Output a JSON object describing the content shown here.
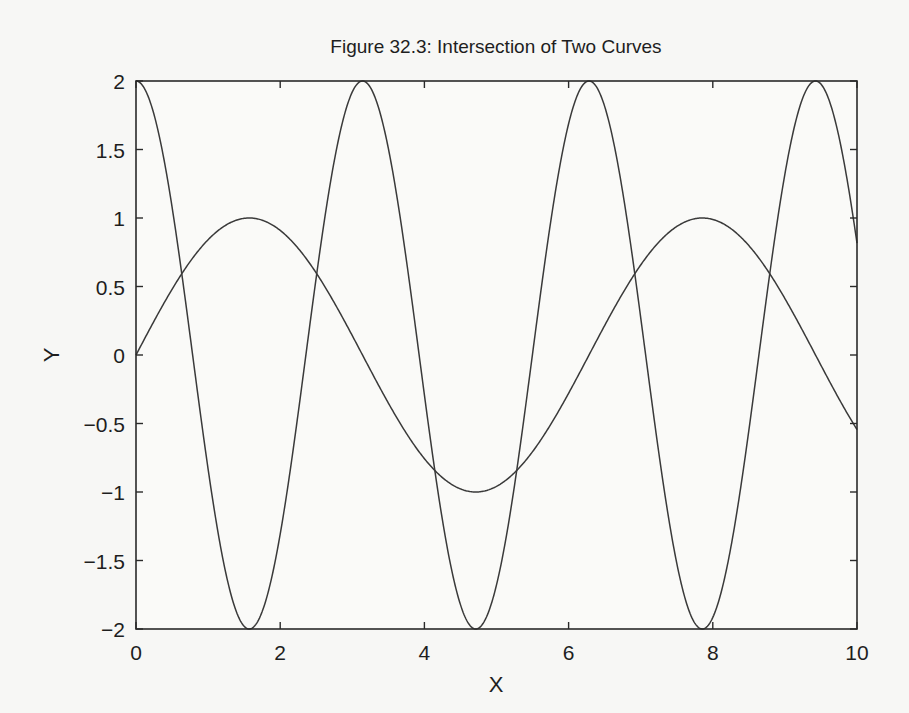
{
  "chart_data": {
    "type": "line",
    "title": "Figure 32.3: Intersection of Two Curves",
    "xlabel": "X",
    "ylabel": "Y",
    "xlim": [
      0,
      10
    ],
    "ylim": [
      -2,
      2
    ],
    "x_ticks": [
      0,
      2,
      4,
      6,
      8,
      10
    ],
    "x_tick_labels": [
      "0",
      "2",
      "4",
      "6",
      "8",
      "10"
    ],
    "y_ticks": [
      2,
      1.5,
      1,
      0.5,
      0,
      -0.5,
      -1,
      -1.5,
      -2
    ],
    "y_tick_labels": [
      "2",
      "1.5",
      "1",
      "0.5",
      "0",
      "−0.5",
      "−1",
      "−1.5",
      "−2"
    ],
    "grid": false,
    "legend": null,
    "series": [
      {
        "name": "sin(x)",
        "expression": "sin(x)",
        "x": [
          0,
          1,
          1.5708,
          2,
          3,
          4,
          4.7124,
          5,
          6,
          7,
          7.854,
          8,
          9,
          10
        ],
        "values": [
          0,
          0.841,
          1.0,
          0.909,
          0.141,
          -0.757,
          -1.0,
          -0.959,
          -0.279,
          0.657,
          1.0,
          0.989,
          0.412,
          -0.544
        ]
      },
      {
        "name": "2cos(2x)",
        "expression": "2*cos(2*x)",
        "x": [
          0,
          0.785,
          1.571,
          2.356,
          3.142,
          3.927,
          4.712,
          5.498,
          6.283,
          7.069,
          7.854,
          8.639,
          9.425,
          10
        ],
        "values": [
          2,
          0,
          -2,
          0,
          2,
          0,
          -2,
          0,
          2,
          0,
          -2,
          0,
          2,
          0.816
        ]
      }
    ],
    "colors": {
      "line": "#3a3a3a",
      "axes": "#2a2a2a",
      "background": "#f7f7f5"
    }
  }
}
